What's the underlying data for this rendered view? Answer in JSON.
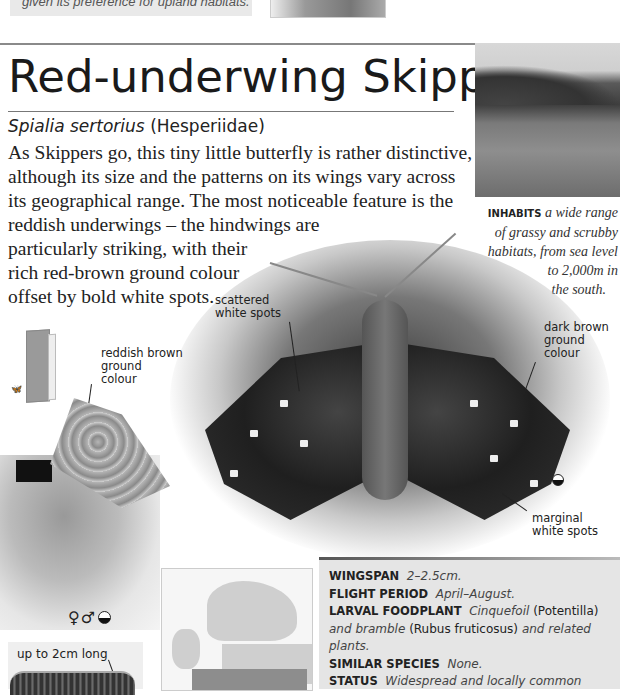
{
  "previous_entry": {
    "caption_fragment": "given its preference for upland habitats."
  },
  "species": {
    "common_name": "Red-underwing Skipper",
    "scientific_name": "Spialia sertorius",
    "family": "(Hesperiidae)"
  },
  "description_lines": [
    "As Skippers go, this tiny little butterfly is rather distinctive,",
    "although its size and the patterns on its wings vary across",
    "its geographical range. The most noticeable feature is the",
    "reddish underwings – the hindwings are",
    "particularly striking, with their",
    "rich red-brown ground colour",
    "offset by bold white spots."
  ],
  "habitat": {
    "label": "INHABITS",
    "text_lines": [
      "a wide range",
      "of grassy and scrubby",
      "habitats, from sea level",
      "to 2,000m in",
      "the south."
    ]
  },
  "annotations": {
    "scattered_white_spots": [
      "scattered",
      "white spots"
    ],
    "reddish_brown": [
      "reddish brown",
      "ground",
      "colour"
    ],
    "dark_brown": [
      "dark brown",
      "ground",
      "colour"
    ],
    "marginal_white_spots": [
      "marginal",
      "white spots"
    ]
  },
  "symbols": {
    "sex_symbols": "♀♂",
    "season_icon": "half-filled-circle"
  },
  "caterpillar": {
    "label": "up to 2cm long"
  },
  "facts": [
    {
      "label": "WINGSPAN",
      "value_html_parts": [
        {
          "t": "i",
          "v": "2–2.5cm."
        }
      ]
    },
    {
      "label": "FLIGHT PERIOD",
      "value_html_parts": [
        {
          "t": "i",
          "v": "April–August."
        }
      ]
    },
    {
      "label": "LARVAL FOODPLANT",
      "value_html_parts": [
        {
          "t": "i",
          "v": "Cinquefoil"
        },
        {
          "t": "n",
          "v": " (Potentilla) "
        },
        {
          "t": "i",
          "v": "and bramble"
        },
        {
          "t": "n",
          "v": " (Rubus fruticosus) "
        },
        {
          "t": "i",
          "v": "and related plants."
        }
      ]
    },
    {
      "label": "SIMILAR SPECIES",
      "value_html_parts": [
        {
          "t": "i",
          "v": "None."
        }
      ]
    },
    {
      "label": "STATUS",
      "value_html_parts": [
        {
          "t": "i",
          "v": "Widespread and locally common"
        }
      ]
    }
  ],
  "colors": {
    "info_box_bg": "#e5e5e5",
    "caption_bg": "#e9e9e9",
    "text": "#222222"
  }
}
